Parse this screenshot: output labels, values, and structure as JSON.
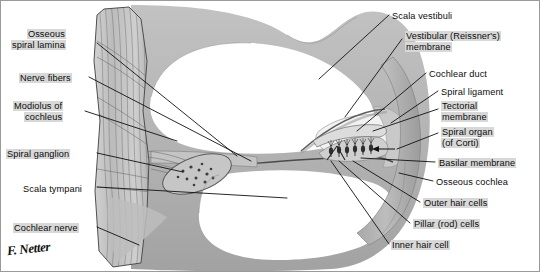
{
  "figure": {
    "signature": "F. Netter",
    "colors": {
      "bone_gray": "#b4b4b4",
      "bone_dark": "#8e8e8e",
      "lumen_white": "#ffffff",
      "label_highlight": "#d8d8d8",
      "line_black": "#111111",
      "fiber_gray": "#9d9d9d"
    }
  },
  "labels_left": [
    {
      "id": "osseous-spiral-lamina",
      "lines": [
        "Osseous",
        "spiral lamina"
      ],
      "highlight": true,
      "x": 10,
      "y": 28
    },
    {
      "id": "nerve-fibers",
      "lines": [
        "Nerve fibers"
      ],
      "highlight": true,
      "x": 18,
      "y": 72
    },
    {
      "id": "modiolus-of-cochleus",
      "lines": [
        "Modiolus of",
        "cochleus"
      ],
      "highlight": true,
      "x": 12,
      "y": 100
    },
    {
      "id": "spiral-ganglion",
      "lines": [
        "Spiral ganglion"
      ],
      "highlight": true,
      "x": 5,
      "y": 148
    },
    {
      "id": "scala-tympani",
      "lines": [
        "Scala tympani"
      ],
      "highlight": false,
      "x": 22,
      "y": 183
    },
    {
      "id": "cochlear-nerve",
      "lines": [
        "Cochlear nerve"
      ],
      "highlight": true,
      "x": 12,
      "y": 222
    }
  ],
  "labels_right": [
    {
      "id": "scala-vestibuli",
      "lines": [
        "Scala vestibuli"
      ],
      "highlight": false,
      "x": 391,
      "y": 10
    },
    {
      "id": "vestibular-membrane",
      "lines": [
        "Vestibular (Reissner's)",
        "membrane"
      ],
      "highlight": true,
      "x": 404,
      "y": 30
    },
    {
      "id": "cochlear-duct",
      "lines": [
        "Cochlear duct"
      ],
      "highlight": false,
      "x": 428,
      "y": 68
    },
    {
      "id": "spiral-ligament",
      "lines": [
        "Spiral ligament"
      ],
      "highlight": false,
      "x": 440,
      "y": 86
    },
    {
      "id": "tectorial-membrane",
      "lines": [
        "Tectorial",
        "membrane"
      ],
      "highlight": true,
      "x": 440,
      "y": 100
    },
    {
      "id": "spiral-organ-of-corti",
      "lines": [
        "Spiral organ",
        "(of Corti)"
      ],
      "highlight": true,
      "x": 440,
      "y": 126
    },
    {
      "id": "basilar-membrane",
      "lines": [
        "Basilar membrane"
      ],
      "highlight": true,
      "x": 437,
      "y": 157
    },
    {
      "id": "osseous-cochlea",
      "lines": [
        "Osseous cochlea"
      ],
      "highlight": false,
      "x": 435,
      "y": 176
    },
    {
      "id": "outer-hair-cells",
      "lines": [
        "Outer hair cells"
      ],
      "highlight": true,
      "x": 422,
      "y": 197
    },
    {
      "id": "pillar-rod-cells",
      "lines": [
        "Pillar (rod) cells"
      ],
      "highlight": true,
      "x": 412,
      "y": 218
    },
    {
      "id": "inner-hair-cell",
      "lines": [
        "Inner hair cell"
      ],
      "highlight": true,
      "x": 390,
      "y": 239
    }
  ]
}
